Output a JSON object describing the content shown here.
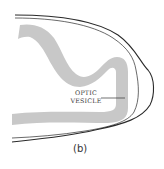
{
  "figure": {
    "caption": "(b)",
    "labels": [
      {
        "line1": "OPTIC",
        "line2": "VESICLE"
      }
    ],
    "colors": {
      "background": "#ffffff",
      "tissue_band": "#c8c8c8",
      "outline": "#2a2a2a",
      "leader_line": "#333333",
      "text": "#3a3a3a"
    }
  }
}
